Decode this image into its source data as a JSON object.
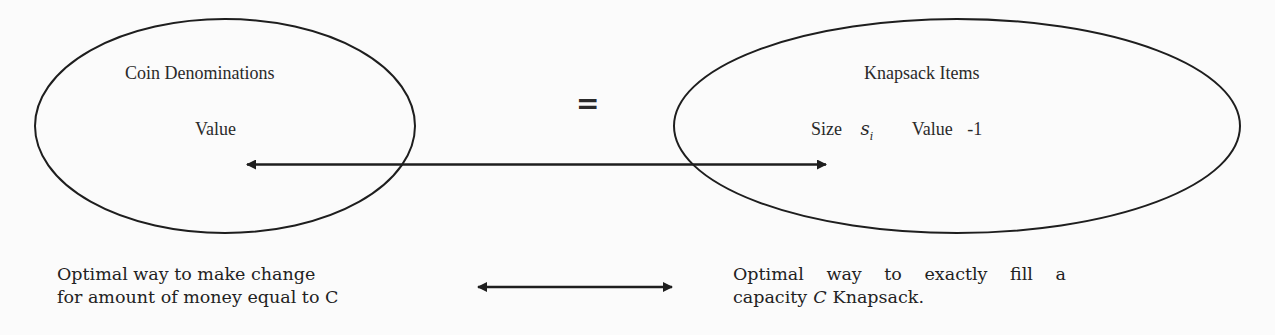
{
  "diagram": {
    "left_set": {
      "title": "Coin Denominations",
      "attribute": "Value"
    },
    "equivalence_symbol": "=",
    "right_set": {
      "title": "Knapsack Items",
      "size_label": "Size",
      "size_symbol": "s",
      "size_subscript": "i",
      "value_label": "Value",
      "value_amount": "-1"
    },
    "left_caption": {
      "line1": "Optimal way to make change",
      "line2": "for amount of money equal to C"
    },
    "right_caption": {
      "line1_words": [
        "Optimal",
        "way",
        "to",
        "exactly",
        "fill",
        "a"
      ],
      "line2_prefix": "capacity",
      "line2_symbol": "C",
      "line2_suffix": "Knapsack."
    },
    "colors": {
      "stroke": "#1e1e1e",
      "background": "#fbfbfb",
      "text": "#222222"
    }
  }
}
